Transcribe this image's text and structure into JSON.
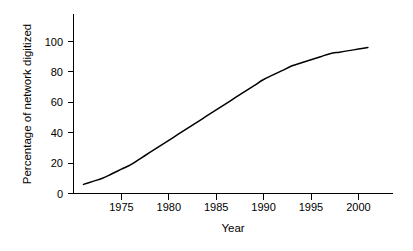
{
  "chart_data": {
    "type": "line",
    "title": "",
    "xlabel": "Year",
    "ylabel": "Percentage of network digitized",
    "xlim": [
      1971,
      1982.5
    ],
    "ylim": [
      0,
      118
    ],
    "xticks": [
      1975,
      1980,
      1985,
      1990,
      1995,
      2000
    ],
    "xtick_labels": [
      "1975",
      "1980",
      "1985",
      "1990",
      "1995",
      "2000"
    ],
    "yticks": [
      0,
      20,
      40,
      60,
      80,
      100
    ],
    "ytick_labels": [
      "0",
      "20",
      "40",
      "60",
      "80",
      "100"
    ],
    "grid": false,
    "legend": null,
    "line_color": "#000000",
    "background_color": "#ffffff",
    "x": [
      1971,
      1972,
      1973,
      1974,
      1975,
      1976,
      1977,
      1978,
      1979,
      1980,
      1981,
      1982,
      1983,
      1984,
      1985,
      1986,
      1987,
      1988,
      1989,
      1990,
      1991,
      1992,
      1993,
      1994,
      1995,
      1996,
      1997,
      1998,
      1999,
      2000,
      2001
    ],
    "values": [
      6,
      8,
      10,
      13,
      16,
      19,
      23,
      27,
      31,
      35,
      39,
      43,
      47,
      51,
      55,
      59,
      63,
      67,
      71,
      75,
      78,
      81,
      84,
      86,
      88,
      90,
      92,
      93,
      94,
      95,
      96
    ],
    "series": [
      {
        "name": "Percentage of network digitized",
        "values": [
          6,
          8,
          10,
          13,
          16,
          19,
          23,
          27,
          31,
          35,
          39,
          43,
          47,
          51,
          55,
          59,
          63,
          67,
          71,
          75,
          78,
          81,
          84,
          86,
          88,
          90,
          92,
          93,
          94,
          95,
          96
        ]
      }
    ]
  },
  "axes": {
    "x_title": "Year",
    "y_title": "Percentage of network digitized"
  }
}
